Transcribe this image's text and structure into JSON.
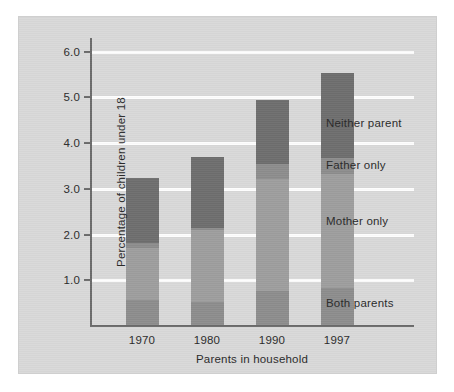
{
  "figure": {
    "background_color": "#d9d9d9",
    "plot_background_color": "#d9d9d9"
  },
  "chart_data": {
    "type": "bar",
    "subtype": "stacked-bar",
    "title": "",
    "xlabel": "Parents in household",
    "ylabel": "Percentage of children under 18",
    "categories": [
      "1970",
      "1980",
      "1990",
      "1997"
    ],
    "ylim": [
      0,
      6.3
    ],
    "yticks": [
      "1.0",
      "2.0",
      "3.0",
      "4.0",
      "5.0",
      "6.0"
    ],
    "ytick_values": [
      1.0,
      2.0,
      3.0,
      4.0,
      5.0,
      6.0
    ],
    "grid": "horizontal-white-lines",
    "legend_position": "right-of-plot-inline-labels",
    "series": [
      {
        "name": "Both parents",
        "color": "#8d8d8d",
        "values": [
          0.55,
          0.5,
          0.75,
          0.82
        ]
      },
      {
        "name": "Mother only",
        "color": "#9e9e9e",
        "values": [
          1.13,
          1.58,
          2.45,
          2.48
        ]
      },
      {
        "name": "Father only",
        "color": "#8d8d8d",
        "values": [
          0.12,
          0.04,
          0.32,
          0.35
        ]
      },
      {
        "name": "Neither parent",
        "color": "#6e6e6e",
        "values": [
          1.42,
          1.55,
          1.41,
          1.87
        ]
      }
    ],
    "totals": [
      3.22,
      3.67,
      4.93,
      5.52
    ],
    "annotations": [
      {
        "label": "Neither parent",
        "value_at": 4.45
      },
      {
        "label": "Father only",
        "value_at": 3.52
      },
      {
        "label": "Mother only",
        "value_at": 2.3
      },
      {
        "label": "Both parents",
        "value_at": 0.5
      }
    ]
  }
}
